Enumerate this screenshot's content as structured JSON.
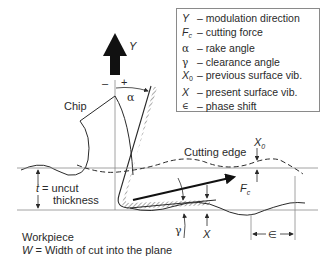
{
  "legend": {
    "items": [
      {
        "symbol": "Y",
        "sub": "",
        "desc": "– modulation direction"
      },
      {
        "symbol": "F",
        "sub": "c",
        "desc": "– cutting force"
      },
      {
        "symbol": "α",
        "sub": "",
        "desc": "– rake angle"
      },
      {
        "symbol": "γ",
        "sub": "",
        "desc": "– clearance angle"
      },
      {
        "symbol": "X",
        "sub": "0",
        "desc": "– previous surface vib."
      },
      {
        "symbol": "X",
        "sub": "",
        "desc": "– present surface vib."
      },
      {
        "symbol": "∈",
        "sub": "",
        "desc": "– phase shift"
      }
    ]
  },
  "labels": {
    "y_arrow": "Y",
    "minus": "–",
    "plus": "+",
    "alpha": "α",
    "chip": "Chip",
    "cutting_edge": "Cutting edge",
    "x0": "X",
    "x0_sub": "0",
    "fc": "F",
    "fc_sub": "c",
    "t_line1": "t = uncut",
    "t_symbol": "t",
    "t_rest": " = uncut",
    "t_line2": "thickness",
    "gamma": "γ",
    "x": "X",
    "epsilon": "∈",
    "workpiece": "Workpiece",
    "w_symbol": "W",
    "w_rest": " = Width of cut into the plane"
  },
  "colors": {
    "ink": "#2a2a2a",
    "guide": "#8a8a8a",
    "arrow": "#111111"
  }
}
